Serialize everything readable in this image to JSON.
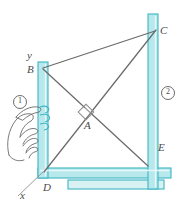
{
  "figure": {
    "colors": {
      "bar_fill": "#b7e8ec",
      "bar_fill_light": "#d8f2f4",
      "bar_stroke": "#3fb5c4",
      "line": "#6b6b6b",
      "label": "#4a4a4a",
      "background": "#ffffff"
    },
    "labels": [
      {
        "id": "label-y",
        "text": "y",
        "x": 27,
        "y": 56
      },
      {
        "id": "label-B",
        "text": "B",
        "x": 28,
        "y": 70
      },
      {
        "id": "label-C",
        "text": "C",
        "x": 160,
        "y": 32
      },
      {
        "id": "label-A",
        "text": "A",
        "x": 86,
        "y": 125
      },
      {
        "id": "label-D",
        "text": "D",
        "x": 44,
        "y": 188
      },
      {
        "id": "label-E",
        "text": "E",
        "x": 156,
        "y": 148
      },
      {
        "id": "label-x",
        "text": "x",
        "x": 22,
        "y": 194
      }
    ],
    "badges": [
      {
        "id": "badge-1",
        "text": "1",
        "x": 13,
        "y": 101
      },
      {
        "id": "badge-2",
        "text": "2",
        "x": 159,
        "y": 92
      }
    ],
    "members": [
      {
        "id": "left-vertical-post",
        "note": "vertical bar from B down to D"
      },
      {
        "id": "bottom-horizontal-bar",
        "note": "bar from D to E"
      },
      {
        "id": "right-vertical-post",
        "note": "tall bar through C down past E"
      },
      {
        "id": "base-support-bar",
        "note": "lower horizontal base strip"
      }
    ],
    "linkage_lines": [
      {
        "id": "line-B-C",
        "from": "B",
        "to": "C"
      },
      {
        "id": "line-B-E",
        "from": "B",
        "to": "E"
      },
      {
        "id": "line-D-C",
        "from": "D",
        "to": "C"
      }
    ],
    "markers": [
      {
        "id": "right-angle-marker-A",
        "note": "small square at crossing point A"
      }
    ]
  }
}
